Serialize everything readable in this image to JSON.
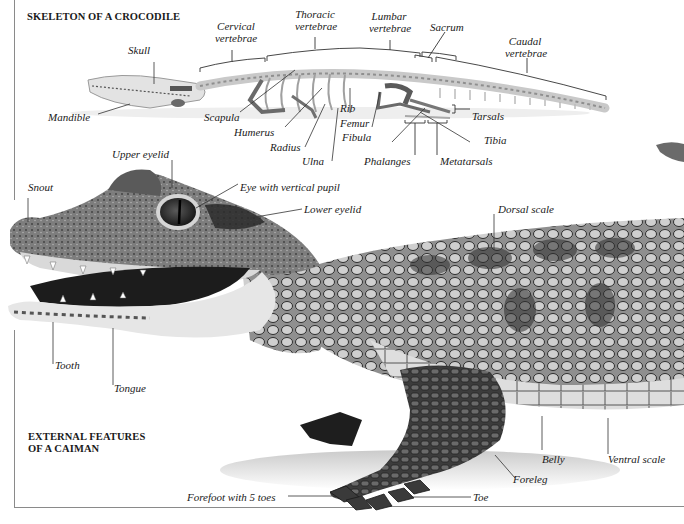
{
  "skeleton_section": {
    "title": "SKELETON OF A CROCODILE",
    "labels": {
      "skull": "Skull",
      "mandible": "Mandible",
      "cervical_1": "Cervical",
      "cervical_2": "vertebrae",
      "thoracic_1": "Thoracic",
      "thoracic_2": "vertebrae",
      "lumbar_1": "Lumbar",
      "lumbar_2": "vertebrae",
      "sacrum": "Sacrum",
      "caudal_1": "Caudal",
      "caudal_2": "vertebrae",
      "scapula": "Scapula",
      "humerus": "Humerus",
      "radius": "Radius",
      "ulna": "Ulna",
      "rib": "Rib",
      "femur": "Femur",
      "fibula": "Fibula",
      "tarsals": "Tarsals",
      "tibia": "Tibia",
      "phalanges": "Phalanges",
      "metatarsals": "Metatarsals"
    }
  },
  "external_section": {
    "title_line1": "EXTERNAL FEATURES",
    "title_line2": "OF A CAIMAN",
    "labels": {
      "upper_eyelid": "Upper eyelid",
      "snout": "Snout",
      "eye": "Eye with vertical pupil",
      "lower_eyelid": "Lower eyelid",
      "dorsal_scale": "Dorsal scale",
      "tooth": "Tooth",
      "tongue": "Tongue",
      "belly": "Belly",
      "ventral_scale": "Ventral scale",
      "foreleg": "Foreleg",
      "forefoot": "Forefoot with 5 toes",
      "toe": "Toe"
    }
  },
  "colors": {
    "ink": "#1a1a1a",
    "leader": "#333333",
    "rule": "#8a8a8a",
    "bone": "#d8d8d8",
    "skin_dark": "#3a3a3a",
    "skin_mid": "#7a7a7a",
    "skin_light": "#c8c8c8",
    "belly": "#dcdcdc"
  }
}
